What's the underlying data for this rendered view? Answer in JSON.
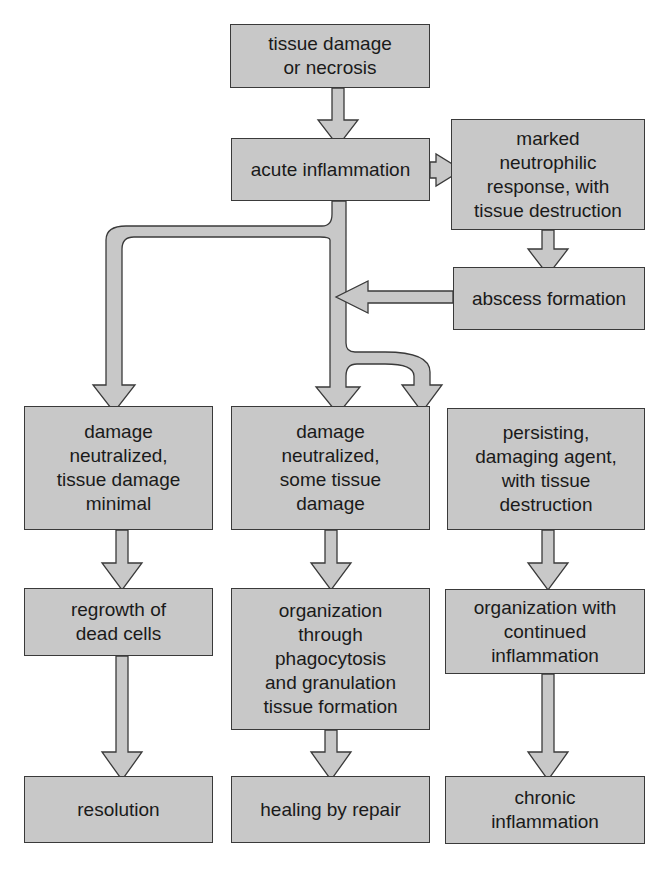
{
  "diagram": {
    "type": "flowchart",
    "colors": {
      "box_fill": "#c8c8c8",
      "box_border": "#3a3a3a",
      "arrow_fill": "#c8c8c8",
      "text": "#1a1a1a"
    },
    "nodes": {
      "tissue_damage": "tissue damage\nor necrosis",
      "acute_inflammation": "acute inflammation",
      "neutrophilic_response": "marked\nneutrophilic\nresponse, with\ntissue destruction",
      "abscess": "abscess formation",
      "damage_minimal": "damage\nneutralized,\ntissue damage\nminimal",
      "some_damage": "damage\nneutralized,\nsome tissue\ndamage",
      "persisting_agent": "persisting,\ndamaging agent,\nwith tissue\ndestruction",
      "regrowth": "regrowth of\ndead cells",
      "organization_phago": "organization\nthrough\nphagocytosis\nand granulation\ntissue formation",
      "organization_continued": "organization with\ncontinued\ninflammation",
      "resolution": "resolution",
      "healing_repair": "healing by repair",
      "chronic": "chronic\ninflammation"
    },
    "edges": [
      [
        "tissue damage or necrosis",
        "acute inflammation"
      ],
      [
        "acute inflammation",
        "marked neutrophilic response, with tissue destruction"
      ],
      [
        "marked neutrophilic response, with tissue destruction",
        "abscess formation"
      ],
      [
        "abscess formation",
        "acute inflammation trunk"
      ],
      [
        "acute inflammation",
        "damage neutralized, tissue damage minimal"
      ],
      [
        "acute inflammation",
        "damage neutralized, some tissue damage"
      ],
      [
        "acute inflammation",
        "persisting, damaging agent, with tissue destruction"
      ],
      [
        "damage neutralized, tissue damage minimal",
        "regrowth of dead cells"
      ],
      [
        "damage neutralized, some tissue damage",
        "organization through phagocytosis and granulation tissue formation"
      ],
      [
        "persisting, damaging agent, with tissue destruction",
        "organization with continued inflammation"
      ],
      [
        "regrowth of dead cells",
        "resolution"
      ],
      [
        "organization through phagocytosis and granulation tissue formation",
        "healing by repair"
      ],
      [
        "organization with continued inflammation",
        "chronic inflammation"
      ]
    ]
  }
}
